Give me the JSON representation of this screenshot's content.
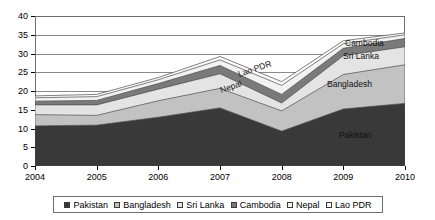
{
  "chart_data": {
    "type": "area",
    "stacked": true,
    "title": "",
    "subtitle": "",
    "xlabel": "",
    "ylabel": "",
    "grid": true,
    "legend_position": "bottom",
    "categories": [
      "2004",
      "2005",
      "2006",
      "2007",
      "2008",
      "2009",
      "2010"
    ],
    "x": [
      2004,
      2005,
      2006,
      2007,
      2008,
      2009,
      2010
    ],
    "xlim": [
      2004,
      2010
    ],
    "ylim": [
      0,
      40
    ],
    "yticks": [
      0,
      5,
      10,
      15,
      20,
      25,
      30,
      35,
      40
    ],
    "series": [
      {
        "name": "Pakistan",
        "color": "#393939",
        "values": [
          10.7,
          10.9,
          13.0,
          15.5,
          9.3,
          15.2,
          16.7
        ],
        "cumulative_top": [
          10.7,
          10.9,
          13.0,
          15.5,
          9.3,
          15.2,
          16.7
        ]
      },
      {
        "name": "Bangladesh",
        "color": "#c2c2c2",
        "values": [
          3.0,
          2.6,
          4.4,
          5.2,
          5.4,
          9.2,
          10.3
        ],
        "cumulative_top": [
          13.7,
          13.5,
          17.4,
          20.7,
          14.7,
          24.4,
          27.0
        ]
      },
      {
        "name": "Sri Lanka",
        "color": "#e4e4e4",
        "values": [
          2.6,
          2.8,
          3.1,
          3.9,
          2.1,
          5.0,
          4.8
        ],
        "cumulative_top": [
          16.3,
          16.3,
          20.5,
          24.6,
          16.8,
          29.4,
          31.8
        ]
      },
      {
        "name": "Cambodia",
        "color": "#7a7a7a",
        "values": [
          1.0,
          1.2,
          1.5,
          2.2,
          2.3,
          2.0,
          2.2
        ],
        "cumulative_top": [
          17.3,
          17.5,
          22.0,
          26.8,
          19.1,
          31.4,
          34.0
        ]
      },
      {
        "name": "Nepal",
        "color": "#f2f2f2",
        "values": [
          0.9,
          1.0,
          1.0,
          1.5,
          2.4,
          1.2,
          1.0
        ],
        "cumulative_top": [
          18.2,
          18.5,
          23.0,
          28.3,
          21.5,
          32.6,
          35.0
        ]
      },
      {
        "name": "Lao PDR",
        "color": "#fbfbfb",
        "values": [
          0.5,
          0.6,
          0.6,
          0.9,
          1.0,
          0.8,
          0.5
        ],
        "cumulative_top": [
          18.7,
          19.1,
          23.6,
          29.2,
          22.5,
          33.4,
          35.5
        ]
      }
    ],
    "inline_annotations": [
      {
        "text": "Lao PDR",
        "series": "Lao PDR",
        "rotated": true
      },
      {
        "text": "Nepal",
        "series": "Nepal",
        "rotated": true
      },
      {
        "text": "Cambodia",
        "series": "Cambodia",
        "rotated": false
      },
      {
        "text": "Sri Lanka",
        "series": "Sri Lanka",
        "rotated": false
      },
      {
        "text": "Bangladesh",
        "series": "Bangladesh",
        "rotated": false
      },
      {
        "text": "Pakistan",
        "series": "Pakistan",
        "rotated": false
      }
    ]
  },
  "legend": {
    "items": [
      {
        "label": "Pakistan",
        "color": "#393939"
      },
      {
        "label": "Bangladesh",
        "color": "#c2c2c2"
      },
      {
        "label": "Sri Lanka",
        "color": "#e4e4e4"
      },
      {
        "label": "Cambodia",
        "color": "#7a7a7a"
      },
      {
        "label": "Nepal",
        "color": "#f2f2f2"
      },
      {
        "label": "Lao PDR",
        "color": "#fbfbfb"
      }
    ]
  },
  "annotations": {
    "lao_pdr": "Lao PDR",
    "nepal": "Nepal",
    "cambodia": "Cambodia",
    "sri_lanka": "Sri Lanka",
    "bangladesh": "Bangladesh",
    "pakistan": "Pakistan"
  }
}
